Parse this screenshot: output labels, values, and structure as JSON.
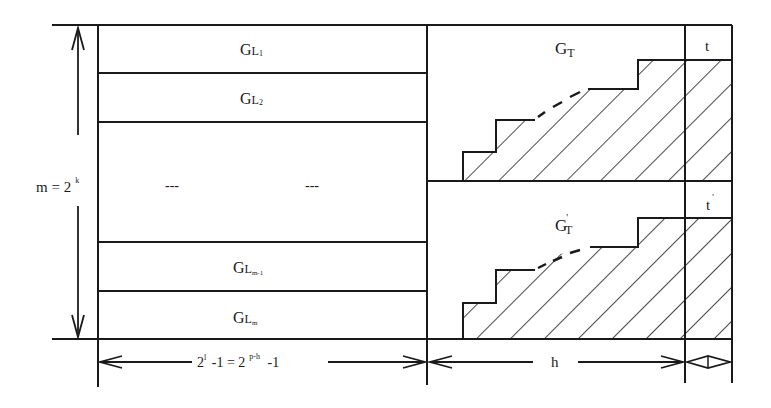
{
  "diagram": {
    "left_blocks": [
      {
        "base": "G",
        "sub": "L",
        "idx": "1"
      },
      {
        "base": "G",
        "sub": "L",
        "idx": "2"
      },
      {
        "ellipsis_left": "---",
        "ellipsis_right": "---"
      },
      {
        "base": "G",
        "sub": "L",
        "idx": "m-1"
      },
      {
        "base": "G",
        "sub": "L",
        "idx": "m"
      }
    ],
    "m_label": {
      "text": "m = 2",
      "sup": "k"
    },
    "gt_label": {
      "base": "G",
      "sub": "T"
    },
    "gt_prime_label": {
      "base": "G",
      "prime": "'",
      "sub": "T"
    },
    "t_label": "t",
    "t_prime_label": {
      "base": "t",
      "prime": "'"
    },
    "bottom_left_dim": {
      "part1": "2",
      "sup1": "l",
      "part2": " -1 = 2",
      "sup2": "p-h",
      "part3": "  -1"
    },
    "bottom_mid_dim": "h",
    "colors": {
      "ink": "#1a1a1a",
      "background": "#ffffff"
    }
  }
}
